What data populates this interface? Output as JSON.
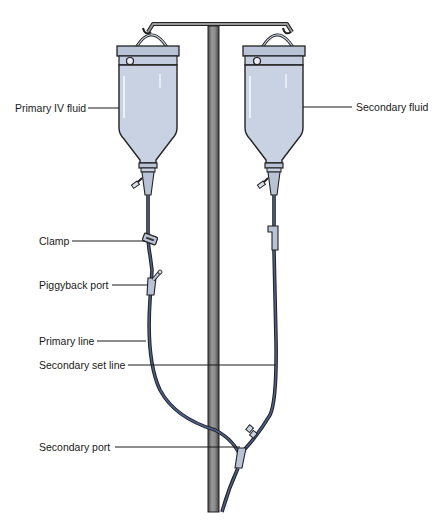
{
  "labels": {
    "primary_iv_fluid": "Primary IV fluid",
    "secondary_fluid": "Secondary fluid",
    "clamp": "Clamp",
    "piggyback_port": "Piggyback port",
    "primary_line": "Primary line",
    "secondary_set_line": "Secondary set line",
    "secondary_port": "Secondary port"
  },
  "colors": {
    "bottle_fill": "#c9d2e3",
    "bottle_cap": "#b9c3d6",
    "tubing": "#3c5078",
    "pole": "#6a6a6a",
    "pole_highlight": "#a8a8a8",
    "leader": "#1a1a1a"
  }
}
